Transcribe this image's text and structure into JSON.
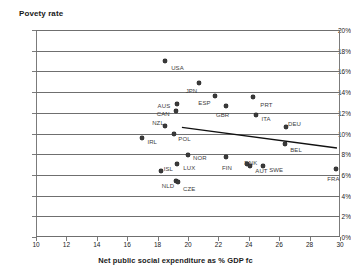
{
  "top_partial_text": "",
  "chart_data": {
    "type": "scatter",
    "title": "Povety rate",
    "xlabel": "Net public social expenditure as % GDP fc",
    "ylabel": "Povety rate",
    "xlim": [
      10,
      30
    ],
    "ylim": [
      0,
      20
    ],
    "xticks": [
      "10",
      "12",
      "14",
      "16",
      "18",
      "20",
      "22",
      "24",
      "26",
      "28",
      "30"
    ],
    "xtick_values": [
      10,
      12,
      14,
      16,
      18,
      20,
      22,
      24,
      26,
      28,
      30
    ],
    "yticks": [
      "0%",
      "2%",
      "4%",
      "6%",
      "8%",
      "10%",
      "12%",
      "14%",
      "16%",
      "18%",
      "20%"
    ],
    "ytick_values": [
      0,
      2,
      4,
      6,
      8,
      10,
      12,
      14,
      16,
      18,
      20
    ],
    "grid": "horizontal",
    "legend": "none",
    "marker_color": "#3a3a3a",
    "gridline_color": "#6f6f6f",
    "trendline": {
      "show": true,
      "color": "#111111",
      "x_start": 19.6,
      "y_start": 10.6,
      "x_end": 29.8,
      "y_end": 8.6
    },
    "points": [
      {
        "label": "USA",
        "x": 18.5,
        "y": 17.0,
        "lx": 6,
        "ly": 4
      },
      {
        "label": "JPN",
        "x": 20.7,
        "y": 14.85,
        "lx": -13,
        "ly": 5
      },
      {
        "label": "AUS",
        "x": 19.25,
        "y": 12.85,
        "lx": -19,
        "ly": -1
      },
      {
        "label": "CAN",
        "x": 19.2,
        "y": 12.2,
        "lx": -19,
        "ly": 0
      },
      {
        "label": "ESP",
        "x": 21.8,
        "y": 13.6,
        "lx": -17,
        "ly": 4
      },
      {
        "label": "GBR",
        "x": 22.5,
        "y": 12.7,
        "lx": -10,
        "ly": 6
      },
      {
        "label": "PRT",
        "x": 24.3,
        "y": 13.5,
        "lx": 7,
        "ly": 5
      },
      {
        "label": "ITA",
        "x": 24.5,
        "y": 11.8,
        "lx": 5,
        "ly": 1
      },
      {
        "label": "DEU",
        "x": 26.45,
        "y": 10.6,
        "lx": 2,
        "ly": -6
      },
      {
        "label": "NZL",
        "x": 18.5,
        "y": 10.7,
        "lx": -13,
        "ly": -6
      },
      {
        "label": "IRL",
        "x": 17.0,
        "y": 9.6,
        "lx": 5,
        "ly": 1
      },
      {
        "label": "POL",
        "x": 19.1,
        "y": 10.0,
        "lx": 4,
        "ly": 2
      },
      {
        "label": "BEL",
        "x": 26.4,
        "y": 9.0,
        "lx": 5,
        "ly": 3
      },
      {
        "label": "NOR",
        "x": 20.0,
        "y": 7.9,
        "lx": 5,
        "ly": 0
      },
      {
        "label": "FIN",
        "x": 22.5,
        "y": 7.75,
        "lx": -4,
        "ly": 8
      },
      {
        "label": "DNK",
        "x": 23.9,
        "y": 7.05,
        "lx": -3,
        "ly": -4
      },
      {
        "label": "AUT",
        "x": 24.1,
        "y": 6.9,
        "lx": 5,
        "ly": 2
      },
      {
        "label": "SWE",
        "x": 24.95,
        "y": 6.9,
        "lx": 6,
        "ly": 1
      },
      {
        "label": "ISL",
        "x": 18.2,
        "y": 6.4,
        "lx": 3,
        "ly": -5
      },
      {
        "label": "LUX",
        "x": 19.3,
        "y": 7.1,
        "lx": 6,
        "ly": 1
      },
      {
        "label": "NLD",
        "x": 19.2,
        "y": 5.45,
        "lx": -14,
        "ly": 2
      },
      {
        "label": "CZE",
        "x": 19.35,
        "y": 5.3,
        "lx": 5,
        "ly": 4
      },
      {
        "label": "FRA",
        "x": 29.75,
        "y": 6.6,
        "lx": -9,
        "ly": 7
      }
    ]
  }
}
